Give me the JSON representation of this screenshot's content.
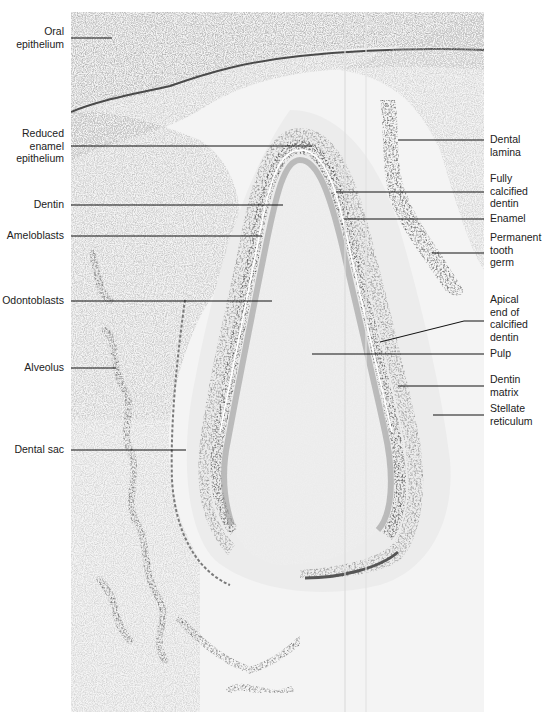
{
  "figure": {
    "colors": {
      "background": "#ffffff",
      "tissue_light": "#e2e2e2",
      "tissue_mid": "#a8a8a8",
      "tissue_dark": "#555555",
      "leader_line": "#111111",
      "label_text": "#222222"
    }
  },
  "labels_left": [
    {
      "id": "oral-epithelium",
      "lines": [
        "Oral",
        "epithelium"
      ],
      "x_right": 64,
      "y": 0,
      "line_y": 38,
      "line_x2": 112
    },
    {
      "id": "reduced-enamel-epithelium",
      "lines": [
        "Reduced",
        "enamel",
        "epithelium"
      ],
      "x_right": 64,
      "y": 128,
      "line_y": 146,
      "line_x2": 312
    },
    {
      "id": "dentin",
      "lines": [
        "Dentin"
      ],
      "x_right": 64,
      "y": 198,
      "line_y": 205,
      "line_x2": 283
    },
    {
      "id": "ameloblasts",
      "lines": [
        "Ameloblasts"
      ],
      "x_right": 64,
      "y": 229,
      "line_y": 236,
      "line_x2": 262
    },
    {
      "id": "odontoblasts",
      "lines": [
        "Odontoblasts"
      ],
      "x_right": 64,
      "y": 294,
      "line_y": 301,
      "line_x2": 272
    },
    {
      "id": "alveolus",
      "lines": [
        "Alveolus"
      ],
      "x_right": 64,
      "y": 361,
      "line_y": 368,
      "line_x2": 116
    },
    {
      "id": "dental-sac",
      "lines": [
        "Dental sac"
      ],
      "x_right": 64,
      "y": 443,
      "line_y": 450,
      "line_x2": 186
    }
  ],
  "labels_right": [
    {
      "id": "dental-lamina",
      "lines": [
        "Dental",
        "lamina"
      ],
      "x_left": 490,
      "y": 134,
      "line_y": 140,
      "line_x1": 398
    },
    {
      "id": "fully-calcified-dentin",
      "lines": [
        "Fully",
        "calcified",
        "dentin"
      ],
      "x_left": 490,
      "y": 172,
      "line_y": 192,
      "line_x1": 336
    },
    {
      "id": "enamel",
      "lines": [
        "Enamel"
      ],
      "x_left": 490,
      "y": 212,
      "line_y": 219,
      "line_x1": 344
    },
    {
      "id": "permanent-tooth-germ",
      "lines": [
        "Permanent",
        "tooth",
        "germ"
      ],
      "x_left": 490,
      "y": 231,
      "line_y": 253,
      "line_x1": 432
    },
    {
      "id": "apical-end-of-calcified-dentin",
      "lines": [
        "Apical",
        "end of",
        "calcified",
        "dentin"
      ],
      "x_left": 490,
      "y": 292,
      "line_y": 321,
      "line_x1": 380,
      "line_y1": 342
    },
    {
      "id": "pulp",
      "lines": [
        "Pulp"
      ],
      "x_left": 490,
      "y": 348,
      "line_y": 354,
      "line_x1": 312
    },
    {
      "id": "dentin-matrix",
      "lines": [
        "Dentin",
        "matrix"
      ],
      "x_left": 490,
      "y": 374,
      "line_y": 386,
      "line_x1": 398
    },
    {
      "id": "stellate-reticulum",
      "lines": [
        "Stellate",
        "reticulum"
      ],
      "x_left": 490,
      "y": 403,
      "line_y": 415,
      "line_x1": 433
    }
  ]
}
